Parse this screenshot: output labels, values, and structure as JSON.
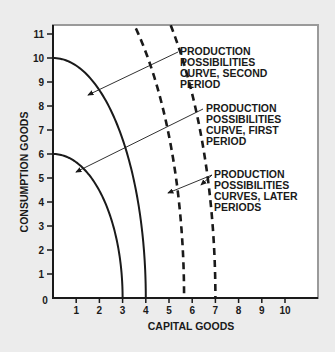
{
  "chart_data": {
    "type": "line",
    "title": "",
    "xlabel": "CAPITAL GOODS",
    "ylabel": "CONSUMPTION GOODS",
    "xlim": [
      0,
      11.3
    ],
    "ylim": [
      0,
      11.4
    ],
    "grid": false,
    "x_ticks": [
      "0",
      "1",
      "2",
      "3",
      "4",
      "5",
      "6",
      "7",
      "8",
      "9",
      "10"
    ],
    "y_ticks": [
      "0",
      "1",
      "2",
      "3",
      "4",
      "5",
      "6",
      "7",
      "8",
      "9",
      "10",
      "11"
    ],
    "series": [
      {
        "name": "Production possibilities curve, first period",
        "style": "solid",
        "x_intercept": 3,
        "y_intercept": 6
      },
      {
        "name": "Production possibilities curve, second period",
        "style": "solid",
        "x_intercept": 4,
        "y_intercept": 10
      },
      {
        "name": "Production possibilities curve, later period 1",
        "style": "dashed",
        "x_intercept": 5.65,
        "y_intercept": 14.5
      },
      {
        "name": "Production possibilities curve, later period 2",
        "style": "dashed",
        "x_intercept": 7.0,
        "y_intercept": 16.5
      }
    ],
    "annotations": [
      {
        "id": "second",
        "lines": [
          "PRODUCTION",
          "POSSIBILITIES",
          "CURVE, SECOND",
          "PERIOD"
        ]
      },
      {
        "id": "first",
        "lines": [
          "PRODUCTION",
          "POSSIBILITIES",
          "CURVE, FIRST",
          "PERIOD"
        ]
      },
      {
        "id": "later",
        "lines": [
          "PRODUCTION",
          "POSSIBILITIES",
          "CURVES, LATER",
          "PERIODS"
        ]
      }
    ]
  },
  "colors": {
    "background": "#ececec",
    "plot_area": "#ffffff",
    "ink": "#1a1a1a",
    "frame": "#9a9a9a"
  }
}
